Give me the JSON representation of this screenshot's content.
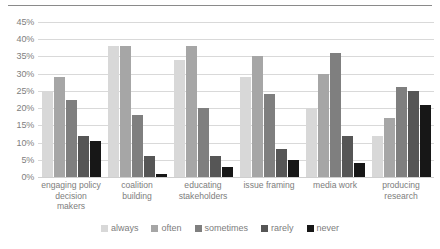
{
  "chart_data": {
    "type": "bar",
    "title": "",
    "subtitle": "",
    "xlabel": "",
    "ylabel": "",
    "ylim": [
      0,
      45
    ],
    "ytick_step": 5,
    "ytick_labels": [
      "0%",
      "5%",
      "10%",
      "15%",
      "20%",
      "25%",
      "30%",
      "35%",
      "40%",
      "45%"
    ],
    "grid": true,
    "legend_position": "bottom",
    "categories": [
      "engaging policy decision makers",
      "coalition building",
      "educating stakeholders",
      "issue framing",
      "media work",
      "producing research"
    ],
    "category_lines": [
      [
        "engaging policy",
        "decision",
        "makers"
      ],
      [
        "coalition",
        "building"
      ],
      [
        "educating",
        "stakeholders"
      ],
      [
        "issue framing"
      ],
      [
        "media work"
      ],
      [
        "producing",
        "research"
      ]
    ],
    "series": [
      {
        "name": "always",
        "color": "#d8d8d8",
        "values": [
          25.0,
          38.0,
          34.0,
          29.0,
          20.0,
          12.0
        ]
      },
      {
        "name": "often",
        "color": "#a6a6a6",
        "values": [
          29.0,
          38.0,
          38.0,
          35.0,
          30.0,
          17.0
        ]
      },
      {
        "name": "sometimes",
        "color": "#7f7f7f",
        "values": [
          22.5,
          18.0,
          20.0,
          24.0,
          36.0,
          26.0
        ]
      },
      {
        "name": "rarely",
        "color": "#565656",
        "values": [
          12.0,
          6.0,
          6.0,
          8.0,
          12.0,
          25.0
        ]
      },
      {
        "name": "never",
        "color": "#171717",
        "values": [
          10.5,
          1.0,
          3.0,
          5.0,
          4.0,
          21.0
        ]
      }
    ]
  }
}
